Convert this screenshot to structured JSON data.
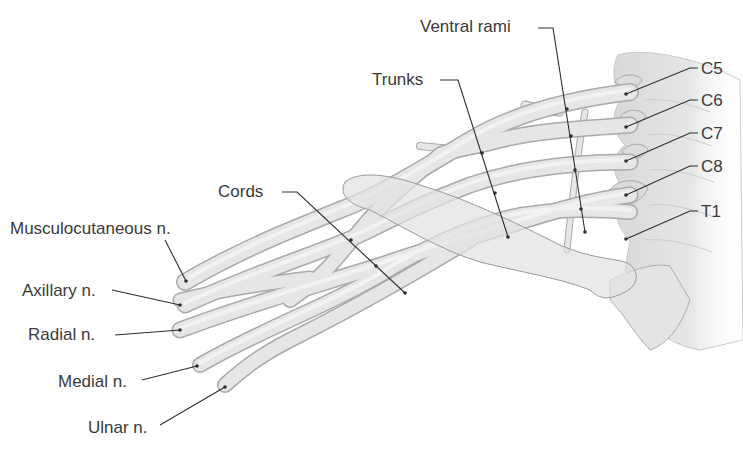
{
  "diagram": {
    "colors": {
      "nerve_fill": "#e4e4e4",
      "nerve_edge": "#a9a9a9",
      "bone_fill": "#e9e9e9",
      "spine_fill": "#e2e2e2",
      "label_text": "#3a3a3a",
      "leader_line": "#2e2e2e"
    },
    "labels": {
      "ventral_rami": "Ventral rami",
      "trunks": "Trunks",
      "cords": "Cords",
      "musculocutaneous": "Musculocutaneous n.",
      "axillary": "Axillary n.",
      "radial": "Radial n.",
      "medial": "Medial n.",
      "ulnar": "Ulnar n.",
      "c5": "C5",
      "c6": "C6",
      "c7": "C7",
      "c8": "C8",
      "t1": "T1"
    }
  }
}
